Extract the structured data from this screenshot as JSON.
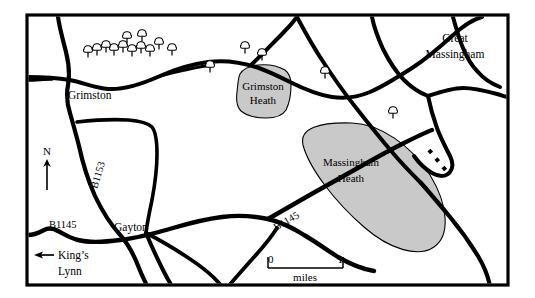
{
  "map": {
    "title": "Grimston and Massingham Heath area map",
    "frame": {
      "x": 27,
      "y": 15,
      "width": 481,
      "height": 270,
      "stroke_color": "#000000",
      "stroke_width": 3.2
    },
    "background_color": "#ffffff",
    "heath_fill_color": "#c9c9c9",
    "heath_stroke_color": "#000000",
    "road_color": "#000000"
  },
  "places": [
    {
      "name": "Grimston",
      "label": "Grimston",
      "x": 68,
      "y": 99
    },
    {
      "name": "Great Massingham",
      "label": "Great",
      "label2": "Massingham",
      "x": 430,
      "y": 38,
      "x2": 430,
      "y2": 54
    },
    {
      "name": "Gayton",
      "label": "Gayton",
      "x": 116,
      "y": 231
    },
    {
      "name": "King's Lynn",
      "label": "King’s",
      "label2": "Lynn",
      "x": 58,
      "y": 258,
      "x2": 58,
      "y2": 273
    }
  ],
  "heaths": [
    {
      "name": "Grimston Heath",
      "label": "Grimston",
      "label2": "Heath",
      "label_x": 258,
      "label_y": 88,
      "label2_x": 258,
      "label2_y": 101
    },
    {
      "name": "Massingham Heath",
      "label": "Massingham",
      "label2": "Heath",
      "label_x": 311,
      "label_y": 165,
      "label2_x": 311,
      "label2_y": 180
    }
  ],
  "roads": [
    {
      "name": "B1153",
      "label": "B1153",
      "x": 100,
      "y": 175,
      "rotation": -73
    },
    {
      "name": "B1145 west",
      "label": "B1145",
      "x": 49,
      "y": 227
    },
    {
      "name": "B1145 east",
      "label": "B1145",
      "x": 275,
      "y": 224,
      "rotation": -27
    }
  ],
  "compass": {
    "name": "north-arrow",
    "label": "N",
    "label_x": 47,
    "label_y": 152,
    "line_x": 47,
    "line_top": 160,
    "line_bottom": 189
  },
  "direction_arrow": {
    "name": "kings-lynn-arrow",
    "points_to": "King’s Lynn",
    "direction": "left",
    "x1": 52,
    "x2": 35,
    "y": 255
  },
  "scale_bar": {
    "name": "scale-bar",
    "left_value": "0",
    "right_value": "1",
    "unit": "miles",
    "x_start": 268,
    "x_end": 343,
    "y": 262,
    "label_y": 277
  },
  "tree_symbols": {
    "name": "woodland-trees",
    "count": 16,
    "positions": [
      {
        "x": 88,
        "y": 52
      },
      {
        "x": 97,
        "y": 50
      },
      {
        "x": 106,
        "y": 47
      },
      {
        "x": 114,
        "y": 49
      },
      {
        "x": 123,
        "y": 46
      },
      {
        "x": 131,
        "y": 50
      },
      {
        "x": 140,
        "y": 47
      },
      {
        "x": 148,
        "y": 50
      },
      {
        "x": 126,
        "y": 38
      },
      {
        "x": 141,
        "y": 36
      },
      {
        "x": 157,
        "y": 44
      },
      {
        "x": 171,
        "y": 49
      },
      {
        "x": 210,
        "y": 67
      },
      {
        "x": 245,
        "y": 48
      },
      {
        "x": 261,
        "y": 54
      },
      {
        "x": 325,
        "y": 73
      },
      {
        "x": 393,
        "y": 113
      }
    ]
  },
  "dashed_segment": {
    "name": "dashed-boundary",
    "description": "short dashed line near right junctions"
  }
}
